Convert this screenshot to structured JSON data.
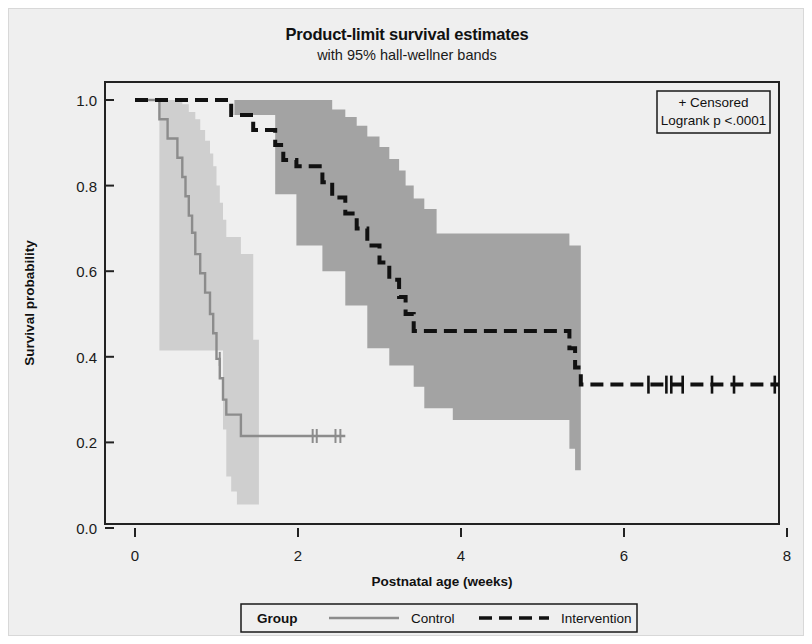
{
  "chart_data": {
    "type": "line",
    "title": "Product-limit survival estimates",
    "subtitle": "with 95% hall-wellner bands",
    "xlabel": "Postnatal age (weeks)",
    "ylabel": "Survival probability",
    "xlim": [
      0,
      8
    ],
    "ylim": [
      0.0,
      1.0
    ],
    "xticks": [
      0,
      2,
      4,
      6,
      8
    ],
    "xtick_labels": [
      "0",
      "2",
      "4",
      "6",
      "8"
    ],
    "yticks": [
      0.0,
      0.2,
      0.4,
      0.6,
      0.8,
      1.0
    ],
    "ytick_labels": [
      "0.0",
      "0.2",
      "0.4",
      "0.6",
      "0.8",
      "1.0"
    ],
    "grid": false,
    "legend_position": "bottom",
    "annotations": {
      "censored_label": "+ Censored",
      "logrank_label": "Logrank p <.0001"
    },
    "legend": {
      "group_label": "Group",
      "entries": [
        {
          "name": "Control",
          "style": "solid",
          "color": "#8c8c8c"
        },
        {
          "name": "Intervention",
          "style": "dashed",
          "color": "#111111"
        }
      ]
    },
    "series": [
      {
        "name": "Control",
        "style": "solid",
        "color": "#8c8c8c",
        "band_color": "#c9c9c9",
        "steps": [
          [
            0.0,
            1.0
          ],
          [
            0.3,
            1.0
          ],
          [
            0.3,
            0.955
          ],
          [
            0.4,
            0.955
          ],
          [
            0.4,
            0.91
          ],
          [
            0.52,
            0.91
          ],
          [
            0.52,
            0.865
          ],
          [
            0.58,
            0.865
          ],
          [
            0.58,
            0.82
          ],
          [
            0.62,
            0.82
          ],
          [
            0.62,
            0.775
          ],
          [
            0.66,
            0.775
          ],
          [
            0.66,
            0.73
          ],
          [
            0.7,
            0.73
          ],
          [
            0.7,
            0.69
          ],
          [
            0.74,
            0.69
          ],
          [
            0.74,
            0.64
          ],
          [
            0.8,
            0.64
          ],
          [
            0.8,
            0.595
          ],
          [
            0.86,
            0.595
          ],
          [
            0.86,
            0.55
          ],
          [
            0.92,
            0.55
          ],
          [
            0.92,
            0.5
          ],
          [
            0.96,
            0.5
          ],
          [
            0.96,
            0.455
          ],
          [
            1.0,
            0.455
          ],
          [
            1.0,
            0.395
          ],
          [
            1.04,
            0.395
          ],
          [
            1.04,
            0.35
          ],
          [
            1.08,
            0.35
          ],
          [
            1.08,
            0.3
          ],
          [
            1.12,
            0.3
          ],
          [
            1.12,
            0.265
          ],
          [
            1.3,
            0.265
          ],
          [
            1.3,
            0.215
          ],
          [
            2.58,
            0.215
          ]
        ],
        "band_upper": [
          [
            0.0,
            1.0
          ],
          [
            0.3,
            1.0
          ],
          [
            0.4,
            1.0
          ],
          [
            0.52,
            1.0
          ],
          [
            0.58,
            0.99
          ],
          [
            0.66,
            0.972
          ],
          [
            0.74,
            0.955
          ],
          [
            0.8,
            0.93
          ],
          [
            0.86,
            0.905
          ],
          [
            0.92,
            0.875
          ],
          [
            0.96,
            0.845
          ],
          [
            1.0,
            0.8
          ],
          [
            1.04,
            0.76
          ],
          [
            1.08,
            0.72
          ],
          [
            1.12,
            0.68
          ],
          [
            1.3,
            0.64
          ],
          [
            1.45,
            0.44
          ],
          [
            1.52,
            0.44
          ]
        ],
        "band_lower": [
          [
            0.0,
            1.0
          ],
          [
            0.24,
            1.0
          ],
          [
            0.3,
            0.415
          ],
          [
            1.04,
            0.415
          ],
          [
            1.08,
            0.23
          ],
          [
            1.12,
            0.12
          ],
          [
            1.18,
            0.085
          ],
          [
            1.25,
            0.055
          ],
          [
            1.3,
            0.055
          ],
          [
            1.52,
            0.055
          ]
        ],
        "censored": [
          [
            1.04,
            0.395
          ],
          [
            2.18,
            0.215
          ],
          [
            2.23,
            0.215
          ],
          [
            2.46,
            0.215
          ],
          [
            2.52,
            0.215
          ]
        ]
      },
      {
        "name": "Intervention",
        "style": "dashed",
        "color": "#111111",
        "band_color": "#9a9a9a",
        "steps": [
          [
            0.0,
            1.0
          ],
          [
            1.18,
            1.0
          ],
          [
            1.18,
            0.965
          ],
          [
            1.45,
            0.965
          ],
          [
            1.45,
            0.93
          ],
          [
            1.72,
            0.93
          ],
          [
            1.72,
            0.895
          ],
          [
            1.82,
            0.895
          ],
          [
            1.82,
            0.86
          ],
          [
            1.98,
            0.86
          ],
          [
            1.98,
            0.845
          ],
          [
            2.3,
            0.845
          ],
          [
            2.3,
            0.808
          ],
          [
            2.42,
            0.808
          ],
          [
            2.42,
            0.772
          ],
          [
            2.58,
            0.772
          ],
          [
            2.58,
            0.735
          ],
          [
            2.72,
            0.735
          ],
          [
            2.72,
            0.7
          ],
          [
            2.85,
            0.7
          ],
          [
            2.85,
            0.66
          ],
          [
            3.0,
            0.66
          ],
          [
            3.0,
            0.62
          ],
          [
            3.12,
            0.62
          ],
          [
            3.12,
            0.58
          ],
          [
            3.24,
            0.58
          ],
          [
            3.24,
            0.54
          ],
          [
            3.32,
            0.54
          ],
          [
            3.32,
            0.5
          ],
          [
            3.42,
            0.5
          ],
          [
            3.42,
            0.46
          ],
          [
            5.33,
            0.46
          ],
          [
            5.33,
            0.42
          ],
          [
            5.4,
            0.42
          ],
          [
            5.4,
            0.375
          ],
          [
            5.47,
            0.375
          ],
          [
            5.47,
            0.335
          ],
          [
            7.9,
            0.335
          ]
        ],
        "band_upper": [
          [
            0.0,
            1.0
          ],
          [
            1.18,
            1.0
          ],
          [
            1.72,
            1.0
          ],
          [
            2.3,
            1.0
          ],
          [
            2.42,
            0.978
          ],
          [
            2.58,
            0.96
          ],
          [
            2.72,
            0.94
          ],
          [
            2.85,
            0.915
          ],
          [
            3.0,
            0.89
          ],
          [
            3.12,
            0.862
          ],
          [
            3.24,
            0.835
          ],
          [
            3.32,
            0.8
          ],
          [
            3.42,
            0.77
          ],
          [
            3.55,
            0.745
          ],
          [
            3.7,
            0.688
          ],
          [
            5.25,
            0.688
          ],
          [
            5.33,
            0.66
          ],
          [
            5.47,
            0.63
          ]
        ],
        "band_lower": [
          [
            0.0,
            1.0
          ],
          [
            1.18,
            1.0
          ],
          [
            1.22,
            0.965
          ],
          [
            1.45,
            0.965
          ],
          [
            1.72,
            0.78
          ],
          [
            1.98,
            0.66
          ],
          [
            2.3,
            0.6
          ],
          [
            2.58,
            0.52
          ],
          [
            2.85,
            0.42
          ],
          [
            3.12,
            0.38
          ],
          [
            3.42,
            0.33
          ],
          [
            3.55,
            0.28
          ],
          [
            3.9,
            0.252
          ],
          [
            5.25,
            0.252
          ],
          [
            5.33,
            0.185
          ],
          [
            5.4,
            0.135
          ],
          [
            5.47,
            0.135
          ]
        ],
        "censored": [
          [
            6.3,
            0.335
          ],
          [
            6.52,
            0.335
          ],
          [
            6.58,
            0.335
          ],
          [
            6.72,
            0.335
          ],
          [
            7.08,
            0.335
          ],
          [
            7.35,
            0.335
          ],
          [
            7.85,
            0.335
          ]
        ]
      }
    ]
  }
}
